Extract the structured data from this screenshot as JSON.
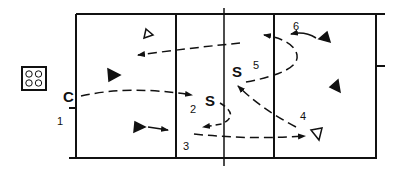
{
  "diagram": {
    "type": "volleyball drill diagram",
    "colors": {
      "line": "#111111",
      "background": "#ffffff"
    },
    "labels": {
      "coach": "C",
      "setter_front": "S",
      "setter_back": "S",
      "n1": "1",
      "n2": "2",
      "n3": "3",
      "n4": "4",
      "n5": "5",
      "n6": "6"
    },
    "icons": {
      "ball_cart": "ball-cart-icon",
      "player_filled": "filled-triangle-player-icon",
      "player_open": "open-triangle-player-icon"
    }
  }
}
